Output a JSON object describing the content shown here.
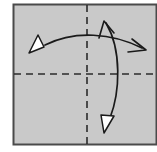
{
  "figure": {
    "type": "origami-fold-instruction-diagram",
    "title": "Origami folding step: square sheet with horizontal and vertical crease lines and two rotation arrows",
    "canvas": {
      "width": 157,
      "height": 152
    },
    "colors": {
      "page_background": "#ffffff",
      "sheet_fill": "#c9c9c9",
      "sheet_border": "#4a4a4a",
      "crease_line": "#2b2b2b",
      "arrow_stroke": "#1a1a1a",
      "arrowhead_fill": "#ffffff",
      "arrowhead_stroke": "#1a1a1a"
    },
    "sheet": {
      "name": "paper-square",
      "x": 13.5,
      "y": 4.5,
      "width": 143,
      "height": 140,
      "fill": "#c9c9c9",
      "stroke": "#4a4a4a",
      "stroke_width": 2
    },
    "creases": [
      {
        "name": "horizontal-crease-line",
        "orientation": "horizontal",
        "x1": 14,
        "y1": 74,
        "x2": 157,
        "y2": 74,
        "dash": "7 5",
        "stroke_width": 1.6
      },
      {
        "name": "vertical-crease-line",
        "orientation": "vertical",
        "x1": 87,
        "y1": 5,
        "x2": 87,
        "y2": 144,
        "dash": "7 5",
        "stroke_width": 1.6
      }
    ],
    "arrows": [
      {
        "name": "horizontal-rotation-arrow",
        "description": "Arc sweeping across the sheet horizontally, solid white triangular head at the left end, thin open head at the right end",
        "path": "M 45 45 C 75 30, 112 33, 142 48",
        "stroke_width": 1.7,
        "head_start": {
          "type": "solid-triangle",
          "name": "left-solid-arrowhead",
          "points": "44,47 29,53 38,35",
          "fill": "#ffffff"
        },
        "head_end": {
          "type": "open-barb",
          "name": "right-open-arrowhead",
          "points": "132,39 146,50 128,52",
          "stroke_width": 1.6
        }
      },
      {
        "name": "vertical-rotation-arrow",
        "description": "Arc sweeping down the right side of the sheet, thin open head at the top end, solid white triangular head at the bottom end",
        "path": "M 106 23 C 122 50, 120 92, 110 118",
        "stroke_width": 1.7,
        "head_start": {
          "type": "open-barb",
          "name": "top-open-arrowhead",
          "points": "99,38 104,21 114,33",
          "stroke_width": 1.6
        },
        "head_end": {
          "type": "solid-triangle",
          "name": "bottom-solid-arrowhead",
          "points": "114,116 104,133 101,115",
          "fill": "#ffffff"
        }
      }
    ]
  }
}
